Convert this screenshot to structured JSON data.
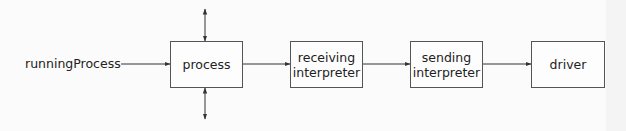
{
  "diagram": {
    "input_label": "runningProcess",
    "nodes": [
      {
        "id": "process",
        "label": "process"
      },
      {
        "id": "receiving-interpreter",
        "label": "receiving interpreter",
        "line1": "receiving",
        "line2": "interpreter"
      },
      {
        "id": "sending-interpreter",
        "label": "sending interpreter",
        "line1": "sending",
        "line2": "interpreter"
      },
      {
        "id": "driver",
        "label": "driver"
      }
    ],
    "edges": [
      {
        "from": "runningProcess",
        "to": "process",
        "type": "arrow"
      },
      {
        "from": "process",
        "to": "receiving-interpreter",
        "type": "arrow"
      },
      {
        "from": "receiving-interpreter",
        "to": "sending-interpreter",
        "type": "arrow"
      },
      {
        "from": "sending-interpreter",
        "to": "driver",
        "type": "arrow"
      },
      {
        "from": "process",
        "to": "top",
        "type": "bidirectional-arrow"
      },
      {
        "from": "process",
        "to": "bottom",
        "type": "bidirectional-arrow"
      }
    ],
    "colors": {
      "line": "#333333",
      "box_border": "#555555",
      "text": "#222222",
      "background": "#fbfbfb"
    }
  }
}
